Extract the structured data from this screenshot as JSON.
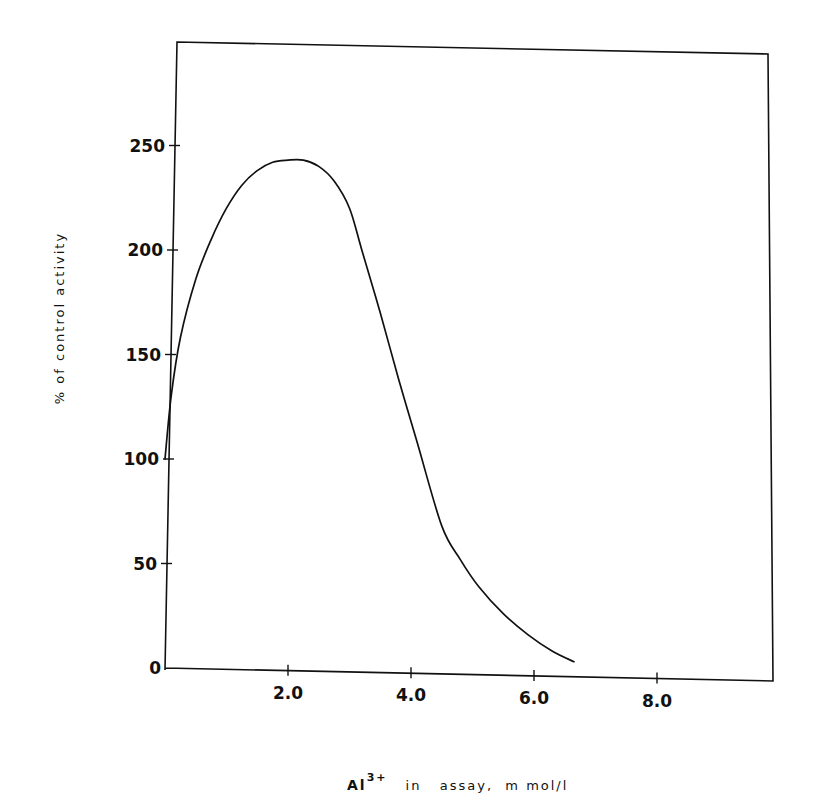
{
  "chart_data": {
    "type": "line",
    "title": "",
    "xlabel_parts": {
      "ion": "Al",
      "charge": "3+",
      "rest": "in   assay,  m mol/l"
    },
    "ylabel": "% of control activity",
    "xlim": [
      0,
      9.9
    ],
    "ylim": [
      0,
      300
    ],
    "x_ticks": [
      2.0,
      4.0,
      6.0,
      8.0
    ],
    "x_tick_labels": [
      "2.0",
      "4.0",
      "6.0",
      "8.0"
    ],
    "y_ticks": [
      0,
      50,
      100,
      150,
      200,
      250
    ],
    "y_tick_labels": [
      "0",
      "50",
      "100",
      "150",
      "200",
      "250"
    ],
    "grid": false,
    "legend": "none",
    "series": [
      {
        "name": "activity",
        "x": [
          0.0,
          0.1,
          0.25,
          0.5,
          0.75,
          1.0,
          1.25,
          1.5,
          1.75,
          2.0,
          2.25,
          2.5,
          2.75,
          3.0,
          3.2,
          3.5,
          3.8,
          4.1,
          4.5,
          4.8,
          5.1,
          5.5,
          5.9,
          6.3,
          6.65
        ],
        "y": [
          100,
          130,
          158,
          186,
          205,
          220,
          231,
          238,
          242,
          243,
          243,
          240,
          233,
          220,
          200,
          170,
          138,
          108,
          68,
          52,
          39,
          26,
          16,
          8,
          3
        ]
      }
    ]
  }
}
